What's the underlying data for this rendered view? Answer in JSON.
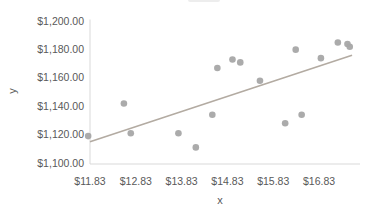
{
  "colors": {
    "point": "#a6a6a6",
    "trendline": "#b3aba2",
    "axis_line": "#d9d9d9",
    "tick_text": "#595959"
  },
  "chart_data": {
    "type": "scatter",
    "title": "",
    "xlabel": "x",
    "ylabel": "y",
    "xlim": [
      11.83,
      17.68
    ],
    "ylim": [
      1100,
      1200
    ],
    "grid": false,
    "legend": "none",
    "x_ticks": [
      11.83,
      12.83,
      13.83,
      14.83,
      15.83,
      16.83
    ],
    "x_tick_labels": [
      "$11.83",
      "$12.83",
      "$13.83",
      "$14.83",
      "$15.83",
      "$16.83"
    ],
    "y_ticks": [
      1200,
      1180,
      1160,
      1140,
      1120,
      1100
    ],
    "y_tick_labels": [
      "$1,200.00",
      "$1,180.00",
      "$1,160.00",
      "$1,140.00",
      "$1,120.00",
      "$1,100.00"
    ],
    "series": [
      {
        "name": "y",
        "points": [
          [
            11.79,
            1119
          ],
          [
            12.57,
            1142
          ],
          [
            12.72,
            1121
          ],
          [
            13.76,
            1121
          ],
          [
            14.14,
            1111
          ],
          [
            14.5,
            1134
          ],
          [
            14.61,
            1167
          ],
          [
            14.94,
            1173
          ],
          [
            15.11,
            1171
          ],
          [
            15.54,
            1158
          ],
          [
            16.09,
            1128
          ],
          [
            16.32,
            1180
          ],
          [
            16.45,
            1134
          ],
          [
            16.87,
            1174
          ],
          [
            17.24,
            1185
          ],
          [
            17.45,
            1184
          ],
          [
            17.5,
            1182
          ]
        ]
      }
    ],
    "trendline": {
      "x1": 11.83,
      "y1": 1115,
      "x2": 17.55,
      "y2": 1176
    }
  }
}
